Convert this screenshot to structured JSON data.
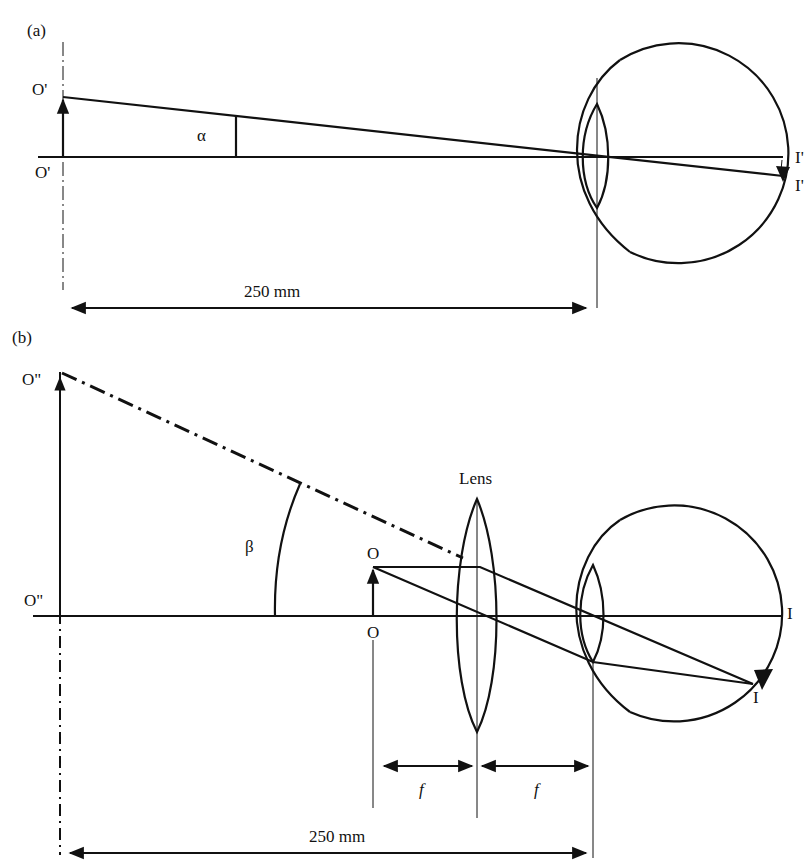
{
  "panel_a": {
    "label": "(a)",
    "object_top": "O'",
    "object_base": "O'",
    "angle": "α",
    "image_axis": "I'",
    "image_point": "I'",
    "distance": "250 mm"
  },
  "panel_b": {
    "label": "(b)",
    "virtual_top": "O\"",
    "virtual_base": "O\"",
    "angle": "β",
    "object_top": "O",
    "object_base": "O",
    "lens_label": "Lens",
    "image_axis": "I",
    "image_point": "I",
    "focal_left": "f",
    "focal_right": "f",
    "distance": "250 mm"
  },
  "colors": {
    "ink": "#111111",
    "background": "#ffffff"
  }
}
